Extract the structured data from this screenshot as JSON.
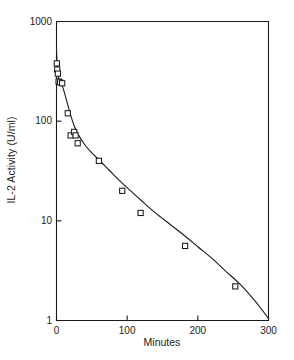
{
  "chart_data": {
    "type": "line",
    "title": "",
    "subtitle": "",
    "xlabel": "Minutes",
    "ylabel": "IL-2 Activity (U/ml)",
    "xscale": "linear",
    "yscale": "log",
    "xlim": [
      0,
      300
    ],
    "ylim": [
      1,
      1000
    ],
    "xticks": [
      0,
      100,
      200,
      300
    ],
    "xtick_labels": [
      "0",
      "100",
      "200",
      "300"
    ],
    "yticks": [
      1,
      10,
      100,
      1000
    ],
    "ytick_labels": [
      "1",
      "10",
      "100",
      "1000"
    ],
    "grid": false,
    "legend": false,
    "legend_position": "none",
    "marker": "open-square",
    "marker_color": "#1a1a1a",
    "line_color": "#1a1a1a",
    "background": "#ffffff",
    "series": [
      {
        "name": "IL-2 Activity",
        "marker": "open-square",
        "x": [
          0.5,
          1,
          2,
          3,
          5,
          8,
          16,
          20,
          25,
          27,
          30,
          60,
          93,
          119,
          182,
          253
        ],
        "values": [
          380,
          330,
          300,
          250,
          245,
          240,
          120,
          72,
          78,
          72,
          60,
          40,
          20,
          12,
          5.6,
          2.2
        ]
      },
      {
        "name": "Fitted decay curve",
        "marker": "none",
        "x": [
          0,
          1,
          2,
          3,
          5,
          8,
          12,
          16,
          20,
          25,
          30,
          40,
          50,
          60,
          75,
          90,
          105,
          120,
          140,
          160,
          180,
          200,
          220,
          240,
          260,
          280,
          300
        ],
        "values": [
          520,
          350,
          300,
          272,
          248,
          228,
          185,
          145,
          115,
          90,
          75,
          58,
          48,
          41,
          32,
          25,
          20,
          16,
          12,
          9.3,
          7.2,
          5.5,
          4.2,
          3.1,
          2.3,
          1.6,
          1.05
        ]
      }
    ],
    "annotations": []
  },
  "axis_titles": {
    "x": "Minutes",
    "y": "IL-2 Activity (U/ml)"
  }
}
